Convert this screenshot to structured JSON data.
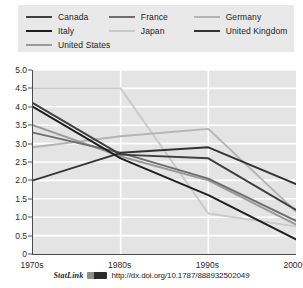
{
  "chart_data": {
    "type": "line",
    "title": "",
    "xlabel": "",
    "ylabel": "",
    "categories": [
      "1970s",
      "1980s",
      "1990s",
      "2000s"
    ],
    "ylim": [
      0,
      5.0
    ],
    "yticks": [
      "0",
      "0.5",
      "1.0",
      "1.5",
      "2.0",
      "2.5",
      "3.0",
      "3.5",
      "4.0",
      "4.5",
      "5.0"
    ],
    "ytick_values": [
      0,
      0.5,
      1.0,
      1.5,
      2.0,
      2.5,
      3.0,
      3.5,
      4.0,
      4.5,
      5.0
    ],
    "grid": "horizontal-and-vertical",
    "legend_position": "top",
    "series": [
      {
        "name": "Canada",
        "color": "#3f3f3f",
        "values": [
          4.1,
          2.7,
          2.6,
          1.2
        ]
      },
      {
        "name": "France",
        "color": "#6e6e6e",
        "values": [
          3.3,
          2.75,
          2.05,
          0.9
        ]
      },
      {
        "name": "Germany",
        "color": "#b4b4b4",
        "values": [
          2.9,
          3.2,
          3.4,
          1.15
        ]
      },
      {
        "name": "Italy",
        "color": "#1e1e1e",
        "values": [
          4.0,
          2.6,
          1.6,
          0.4
        ]
      },
      {
        "name": "Japan",
        "color": "#c9c9c9",
        "values": [
          4.5,
          4.5,
          1.1,
          0.75
        ]
      },
      {
        "name": "United Kingdom",
        "color": "#333333",
        "values": [
          2.0,
          2.75,
          2.9,
          1.9
        ]
      },
      {
        "name": "United States",
        "color": "#9a9a9a",
        "values": [
          3.5,
          2.65,
          2.0,
          0.8
        ]
      }
    ]
  },
  "legend": {
    "rows": [
      [
        {
          "label": "Canada",
          "color": "#3f3f3f"
        },
        {
          "label": "France",
          "color": "#6e6e6e"
        },
        {
          "label": "Germany",
          "color": "#b4b4b4"
        }
      ],
      [
        {
          "label": "Italy",
          "color": "#1e1e1e"
        },
        {
          "label": "Japan",
          "color": "#c9c9c9"
        },
        {
          "label": "United Kingdom",
          "color": "#333333"
        }
      ],
      [
        {
          "label": "United States",
          "color": "#9a9a9a"
        }
      ]
    ]
  },
  "footer": {
    "statlink_label": "StatLink",
    "url": "http://dx.doi.org/10.1787/888932502049"
  },
  "colors": {
    "plot_background": "#e4e4e4",
    "legend_background": "#e9e9e9",
    "gridline": "#ffffff",
    "axis": "#4a4a4a",
    "text": "#1c1c1c"
  }
}
